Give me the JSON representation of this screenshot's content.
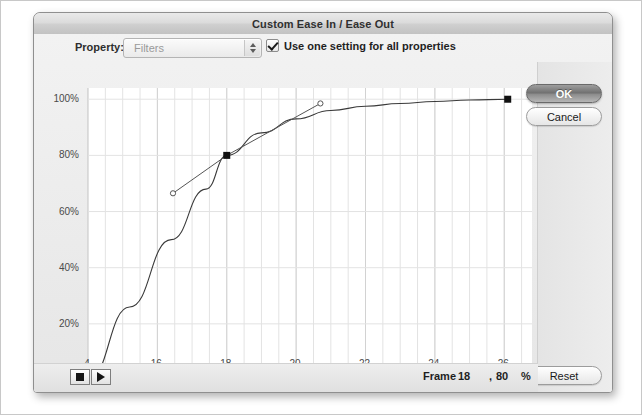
{
  "window": {
    "title": "Custom Ease In / Ease Out"
  },
  "toolbar": {
    "property_label": "Property:",
    "property_value": "Filters",
    "checkbox_label": "Use one setting for all properties",
    "checkbox_checked": true,
    "stepper_icon": "stepper-arrows-icon"
  },
  "buttons": {
    "ok": "OK",
    "cancel": "Cancel",
    "reset": "Reset"
  },
  "transport": {
    "stop_icon": "stop-icon",
    "play_icon": "play-icon"
  },
  "readout": {
    "frame_word": "Frame",
    "frame_value": "18",
    "comma": ",",
    "percent_value": "80",
    "percent_sign": "%"
  },
  "chart_data": {
    "type": "line",
    "title": "",
    "xlabel": "Frames",
    "ylabel": "Tween",
    "xlim": [
      14,
      26.8
    ],
    "ylim": [
      0,
      104
    ],
    "grid": true,
    "legend": false,
    "x_ticks": [
      14,
      16,
      18,
      20,
      22,
      24,
      26
    ],
    "x_tick_labels": [
      "4",
      "16",
      "18",
      "20",
      "22",
      "24",
      "26"
    ],
    "y_ticks": [
      20,
      40,
      60,
      80,
      100
    ],
    "y_tick_labels": [
      "20%",
      "40%",
      "60%",
      "80%",
      "100%"
    ],
    "minor_grid_step_x": 0.5,
    "series": [
      {
        "name": "ease-curve",
        "x": [
          14,
          15.2,
          16.4,
          17.4,
          18,
          19,
          20,
          21,
          22,
          23,
          24,
          25,
          26.1
        ],
        "values": [
          0,
          26,
          50,
          68,
          80,
          88,
          93,
          96,
          97.5,
          98.5,
          99.2,
          99.7,
          100
        ]
      }
    ],
    "control_points": [
      {
        "name": "start-point",
        "x": 14,
        "y": 0,
        "selected": true
      },
      {
        "name": "middle-point",
        "x": 18,
        "y": 80,
        "selected": true
      },
      {
        "name": "end-point",
        "x": 26.1,
        "y": 100,
        "selected": true
      }
    ],
    "tangent_handles": [
      {
        "name": "handle-in",
        "x": 16.45,
        "y": 66.5,
        "anchor_x": 18,
        "anchor_y": 80
      },
      {
        "name": "handle-out",
        "x": 20.7,
        "y": 98.5,
        "anchor_x": 18,
        "anchor_y": 80
      }
    ],
    "colors": {
      "curve": "#3a3a3a",
      "grid": "#e3e3e3",
      "axis": "#b8b8b8",
      "point": "#111111",
      "handle_line": "#555555",
      "plot_bg": "#ffffff"
    }
  }
}
